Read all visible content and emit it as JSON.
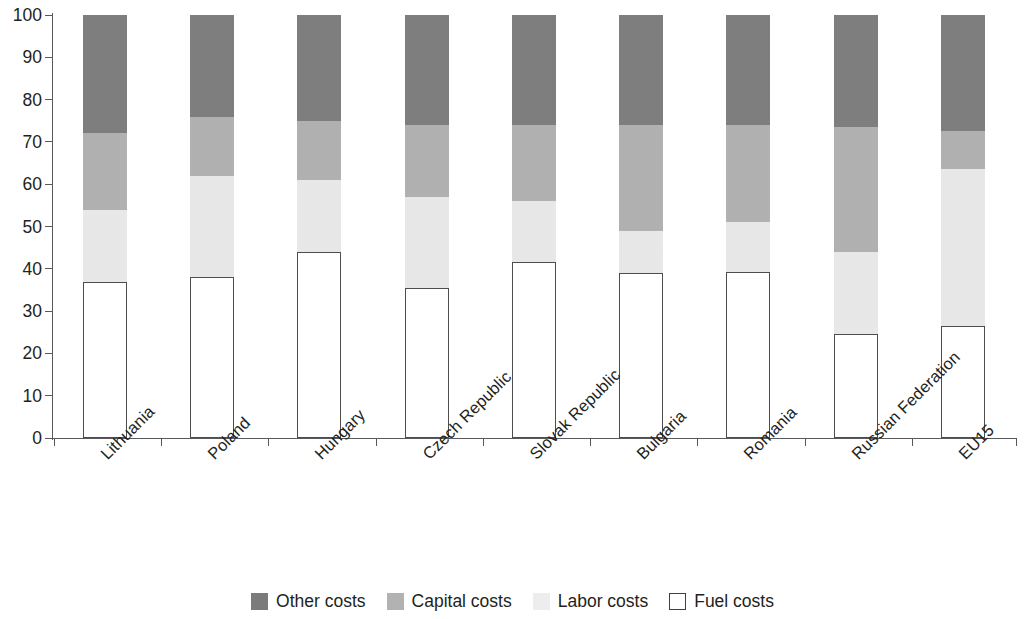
{
  "chart_data": {
    "type": "bar",
    "subtype": "stacked-bar-100-percent",
    "title": "",
    "xlabel": "",
    "ylabel": "",
    "ylim": [
      0,
      100
    ],
    "yticks": [
      0,
      10,
      20,
      30,
      40,
      50,
      60,
      70,
      80,
      90,
      100
    ],
    "grid": false,
    "legend_position": "bottom",
    "stack_order_bottom_to_top": [
      "Fuel costs",
      "Labor costs",
      "Capital costs",
      "Other costs"
    ],
    "categories": [
      "Lithuania",
      "Poland",
      "Hungary",
      "Czech Republic",
      "Slovak Republic",
      "Bulgaria",
      "Romania",
      "Russian Federation",
      "EU15"
    ],
    "series": [
      {
        "name": "Fuel costs",
        "color": "#ffffff",
        "values": [
          37.0,
          38.0,
          44.0,
          35.5,
          41.5,
          39.0,
          39.2,
          24.7,
          26.5
        ]
      },
      {
        "name": "Labor costs",
        "color": "#eeeeee",
        "values": [
          17.0,
          24.0,
          17.0,
          21.5,
          14.5,
          10.0,
          11.8,
          19.3,
          37.0
        ]
      },
      {
        "name": "Capital costs",
        "color": "#b2b2b2",
        "values": [
          18.0,
          14.0,
          14.0,
          17.0,
          18.0,
          25.0,
          23.0,
          29.5,
          9.0
        ]
      },
      {
        "name": "Other costs",
        "color": "#7b7b7b",
        "values": [
          28.0,
          24.0,
          25.0,
          26.0,
          26.0,
          26.0,
          26.0,
          26.5,
          27.5
        ]
      }
    ],
    "cumulative_tops": {
      "Lithuania": [
        37.0,
        54.0,
        72.0,
        100
      ],
      "Poland": [
        38.0,
        62.0,
        76.0,
        100
      ],
      "Hungary": [
        44.0,
        61.0,
        75.0,
        100
      ],
      "Czech Republic": [
        35.5,
        57.0,
        74.0,
        100
      ],
      "Slovak Republic": [
        41.5,
        56.0,
        74.0,
        100
      ],
      "Bulgaria": [
        39.0,
        49.0,
        74.0,
        100
      ],
      "Romania": [
        39.2,
        51.0,
        74.0,
        100
      ],
      "Russian Federation": [
        24.7,
        44.0,
        73.5,
        100
      ],
      "EU15": [
        26.5,
        63.5,
        72.5,
        100
      ]
    }
  },
  "legend": {
    "items": [
      {
        "label": "Other costs",
        "swatch": "sw-other"
      },
      {
        "label": "Capital costs",
        "swatch": "sw-capital"
      },
      {
        "label": "Labor costs",
        "swatch": "sw-labor"
      },
      {
        "label": "Fuel costs",
        "swatch": "sw-fuel"
      }
    ]
  },
  "colors": {
    "other": "#7b7b7b",
    "capital": "#b2b2b2",
    "labor": "#eeeeee",
    "fuel": "#ffffff",
    "axis": "#58595b",
    "text": "#231f20"
  }
}
